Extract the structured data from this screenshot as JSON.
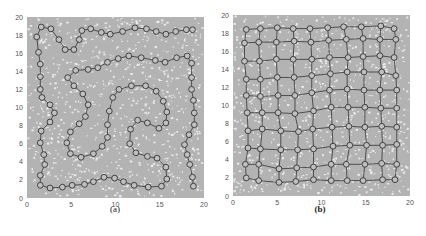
{
  "colors": {
    "background_field": "#b3b3b3",
    "speckle": "#f2f2f2",
    "node_fill": "#c0c0c0",
    "node_stroke": "#333333",
    "edge": "#333333"
  },
  "chart_data": [
    {
      "type": "scatter",
      "panel": "a",
      "title": "",
      "caption": "(a)",
      "xlabel": "",
      "ylabel": "",
      "xlim": [
        0,
        20
      ],
      "ylim": [
        0,
        20
      ],
      "xticks": [
        0,
        5,
        10,
        15,
        20
      ],
      "yticks": [
        0,
        2,
        4,
        6,
        8,
        10,
        12,
        14,
        16,
        18,
        20
      ],
      "grid": false,
      "background": "speckled gray sample cloud filling [0,20]x[0,20]",
      "series": [
        {
          "name": "open path (chain of nodes)",
          "connect": "path",
          "points": [
            [
              18.8,
              1.3
            ],
            [
              18.7,
              2.3
            ],
            [
              18.4,
              3.7
            ],
            [
              18.1,
              4.8
            ],
            [
              17.8,
              5.9
            ],
            [
              18.3,
              7.0
            ],
            [
              18.9,
              8.1
            ],
            [
              18.9,
              9.4
            ],
            [
              18.8,
              10.8
            ],
            [
              18.6,
              12.0
            ],
            [
              18.6,
              13.3
            ],
            [
              18.6,
              14.9
            ],
            [
              18.1,
              15.7
            ],
            [
              16.9,
              15.5
            ],
            [
              15.6,
              15.0
            ],
            [
              14.5,
              15.2
            ],
            [
              12.9,
              15.5
            ],
            [
              11.5,
              15.7
            ],
            [
              10.3,
              15.4
            ],
            [
              9.1,
              15.0
            ],
            [
              8.0,
              14.4
            ],
            [
              6.9,
              14.2
            ],
            [
              5.5,
              14.1
            ],
            [
              4.6,
              13.3
            ],
            [
              5.3,
              12.4
            ],
            [
              6.3,
              11.5
            ],
            [
              6.9,
              10.3
            ],
            [
              6.6,
              9.0
            ],
            [
              5.9,
              8.2
            ],
            [
              4.9,
              7.3
            ],
            [
              4.5,
              6.1
            ],
            [
              4.9,
              4.9
            ],
            [
              6.1,
              4.5
            ],
            [
              7.5,
              4.9
            ],
            [
              8.5,
              5.7
            ],
            [
              9.1,
              6.7
            ],
            [
              9.1,
              8.1
            ],
            [
              9.3,
              9.6
            ],
            [
              9.7,
              11.1
            ],
            [
              10.4,
              12.0
            ],
            [
              11.8,
              12.4
            ],
            [
              13.4,
              12.4
            ],
            [
              14.6,
              11.8
            ],
            [
              15.4,
              10.7
            ],
            [
              15.8,
              9.5
            ],
            [
              15.7,
              8.3
            ],
            [
              14.9,
              7.7
            ],
            [
              13.6,
              8.3
            ],
            [
              12.5,
              8.6
            ],
            [
              11.7,
              7.6
            ],
            [
              11.6,
              6.0
            ],
            [
              12.3,
              5.0
            ],
            [
              13.6,
              4.6
            ],
            [
              14.7,
              4.4
            ],
            [
              15.7,
              3.4
            ],
            [
              15.8,
              2.1
            ],
            [
              15.2,
              1.3
            ],
            [
              13.7,
              1.2
            ],
            [
              12.1,
              1.4
            ],
            [
              10.9,
              1.8
            ],
            [
              9.9,
              2.2
            ],
            [
              8.7,
              2.3
            ],
            [
              7.5,
              1.8
            ],
            [
              6.5,
              1.5
            ],
            [
              5.1,
              1.4
            ],
            [
              4.0,
              1.2
            ],
            [
              2.6,
              1.1
            ],
            [
              1.5,
              1.4
            ],
            [
              1.5,
              2.5
            ],
            [
              2.0,
              3.7
            ],
            [
              1.9,
              4.8
            ],
            [
              1.5,
              6.1
            ],
            [
              1.6,
              7.4
            ],
            [
              2.6,
              8.4
            ],
            [
              3.1,
              9.4
            ],
            [
              2.6,
              10.3
            ],
            [
              1.7,
              11.1
            ],
            [
              1.5,
              12.0
            ],
            [
              1.5,
              13.4
            ],
            [
              1.5,
              14.8
            ],
            [
              1.3,
              16.1
            ],
            [
              1.1,
              17.8
            ],
            [
              1.6,
              18.9
            ],
            [
              2.7,
              18.7
            ],
            [
              3.6,
              17.5
            ],
            [
              4.3,
              16.4
            ],
            [
              5.3,
              16.4
            ],
            [
              5.9,
              17.5
            ],
            [
              6.2,
              18.5
            ],
            [
              7.2,
              18.7
            ],
            [
              8.4,
              18.3
            ],
            [
              9.4,
              18.1
            ],
            [
              10.8,
              18.4
            ],
            [
              12.2,
              18.8
            ],
            [
              13.5,
              18.7
            ],
            [
              14.6,
              18.4
            ],
            [
              15.7,
              18.1
            ],
            [
              16.8,
              18.4
            ],
            [
              18.0,
              18.6
            ],
            [
              18.7,
              18.6
            ]
          ]
        }
      ]
    },
    {
      "type": "scatter",
      "panel": "b",
      "title": "",
      "caption": "(b)",
      "xlabel": "",
      "ylabel": "",
      "xlim": [
        0,
        20
      ],
      "ylim": [
        0,
        20
      ],
      "xticks": [
        0,
        5,
        10,
        15,
        20
      ],
      "yticks": [
        0,
        2,
        4,
        6,
        8,
        10,
        12,
        14,
        16,
        18,
        20
      ],
      "grid": false,
      "background": "speckled gray sample cloud filling [0,20]x[0,20]",
      "series": [
        {
          "name": "10x10 lattice of nodes",
          "connect": "grid",
          "rows": 10,
          "cols": 10,
          "points": [
            [
              [
                1.5,
                2.0
              ],
              [
                2.9,
                1.7
              ],
              [
                5.2,
                1.5
              ],
              [
                7.1,
                1.6
              ],
              [
                9.1,
                1.8
              ],
              [
                11.1,
                1.7
              ],
              [
                12.9,
                1.7
              ],
              [
                14.7,
                1.7
              ],
              [
                16.9,
                1.8
              ],
              [
                18.3,
                1.8
              ]
            ],
            [
              [
                1.4,
                3.5
              ],
              [
                2.9,
                3.5
              ],
              [
                5.2,
                3.0
              ],
              [
                7.2,
                3.1
              ],
              [
                9.1,
                3.2
              ],
              [
                11.1,
                3.5
              ],
              [
                12.8,
                3.5
              ],
              [
                14.9,
                3.5
              ],
              [
                16.8,
                3.6
              ],
              [
                18.5,
                3.5
              ]
            ],
            [
              [
                1.7,
                5.3
              ],
              [
                3.1,
                5.2
              ],
              [
                5.4,
                5.1
              ],
              [
                7.3,
                5.1
              ],
              [
                9.1,
                5.2
              ],
              [
                11.3,
                5.5
              ],
              [
                13.2,
                5.6
              ],
              [
                15.1,
                5.6
              ],
              [
                16.9,
                5.6
              ],
              [
                18.5,
                5.7
              ]
            ],
            [
              [
                1.7,
                7.2
              ],
              [
                3.3,
                7.4
              ],
              [
                5.4,
                7.2
              ],
              [
                7.4,
                7.1
              ],
              [
                9.0,
                7.4
              ],
              [
                11.2,
                7.6
              ],
              [
                13.1,
                7.7
              ],
              [
                14.9,
                7.6
              ],
              [
                16.8,
                7.7
              ],
              [
                18.5,
                7.6
              ]
            ],
            [
              [
                1.6,
                9.2
              ],
              [
                3.3,
                9.2
              ],
              [
                5.1,
                9.2
              ],
              [
                7.0,
                9.1
              ],
              [
                9.1,
                9.4
              ],
              [
                11.1,
                9.8
              ],
              [
                13.0,
                9.8
              ],
              [
                14.9,
                9.8
              ],
              [
                16.7,
                9.7
              ],
              [
                18.5,
                9.7
              ]
            ],
            [
              [
                1.5,
                11.1
              ],
              [
                3.1,
                11.0
              ],
              [
                5.1,
                11.1
              ],
              [
                7.0,
                11.1
              ],
              [
                8.9,
                11.4
              ],
              [
                10.9,
                11.7
              ],
              [
                12.9,
                11.8
              ],
              [
                14.8,
                11.7
              ],
              [
                16.6,
                11.7
              ],
              [
                18.5,
                11.7
              ]
            ],
            [
              [
                1.5,
                12.9
              ],
              [
                3.1,
                12.9
              ],
              [
                5.0,
                13.1
              ],
              [
                6.9,
                13.1
              ],
              [
                8.9,
                13.3
              ],
              [
                11.0,
                13.5
              ],
              [
                12.9,
                13.7
              ],
              [
                14.8,
                13.7
              ],
              [
                16.8,
                13.7
              ],
              [
                18.4,
                13.3
              ]
            ],
            [
              [
                1.3,
                14.9
              ],
              [
                3.0,
                14.9
              ],
              [
                4.9,
                15.1
              ],
              [
                6.8,
                15.1
              ],
              [
                8.9,
                15.1
              ],
              [
                10.9,
                15.3
              ],
              [
                13.0,
                15.3
              ],
              [
                14.7,
                15.4
              ],
              [
                16.6,
                15.5
              ],
              [
                18.2,
                15.3
              ]
            ],
            [
              [
                1.3,
                16.9
              ],
              [
                2.9,
                17.0
              ],
              [
                4.9,
                17.0
              ],
              [
                6.9,
                17.1
              ],
              [
                8.8,
                17.0
              ],
              [
                10.8,
                17.2
              ],
              [
                12.8,
                17.3
              ],
              [
                14.7,
                17.4
              ],
              [
                16.6,
                17.3
              ],
              [
                18.4,
                17.3
              ]
            ],
            [
              [
                1.5,
                18.4
              ],
              [
                3.1,
                18.5
              ],
              [
                5.0,
                18.6
              ],
              [
                6.8,
                18.5
              ],
              [
                8.7,
                18.5
              ],
              [
                10.7,
                18.6
              ],
              [
                12.5,
                18.7
              ],
              [
                14.5,
                18.7
              ],
              [
                16.7,
                18.8
              ],
              [
                18.2,
                18.5
              ]
            ]
          ]
        }
      ]
    }
  ]
}
